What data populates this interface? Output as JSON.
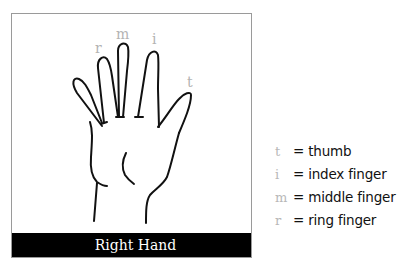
{
  "diagram": {
    "caption": "Right Hand",
    "finger_labels": {
      "ring": "r",
      "middle": "m",
      "index": "i",
      "thumb": "t"
    }
  },
  "legend": {
    "items": [
      {
        "key": "t",
        "text": "= thumb"
      },
      {
        "key": "i",
        "text": "= index finger"
      },
      {
        "key": "m",
        "text": "= middle finger"
      },
      {
        "key": "r",
        "text": "= ring finger"
      }
    ]
  },
  "colors": {
    "label_gray": "#b3b3b3",
    "caption_bg": "#000000",
    "caption_text": "#ffffff",
    "frame_border": "#9a9a9a"
  }
}
